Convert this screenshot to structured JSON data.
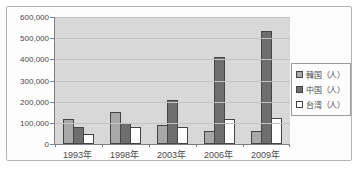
{
  "chart_data": {
    "type": "bar",
    "title": "",
    "categories": [
      "1993年",
      "1998年",
      "2003年",
      "2006年",
      "2009年"
    ],
    "series": [
      {
        "key": "korea",
        "name": "韓国（人）",
        "color": "#a8a8a8",
        "values": [
          120000,
          150000,
          90000,
          60000,
          60000
        ]
      },
      {
        "key": "china",
        "name": "中国（人）",
        "color": "#6e6e6e",
        "values": [
          80000,
          100000,
          210000,
          410000,
          535000
        ]
      },
      {
        "key": "taiwan",
        "name": "台湾（人）",
        "color": "#ffffff",
        "values": [
          45000,
          80000,
          80000,
          120000,
          125000
        ]
      }
    ],
    "xlabel": "",
    "ylabel": "",
    "ylim": [
      0,
      600000
    ],
    "yticks": [
      {
        "value": 0,
        "label": "0"
      },
      {
        "value": 100000,
        "label": "100,000"
      },
      {
        "value": 200000,
        "label": "200,000"
      },
      {
        "value": 300000,
        "label": "300,000"
      },
      {
        "value": 400000,
        "label": "400,000"
      },
      {
        "value": 500000,
        "label": "500,000"
      },
      {
        "value": 600000,
        "label": "600,000"
      }
    ],
    "grid": true,
    "legend_position": "right",
    "plot_background": "#d8d8d8",
    "gridline_color": "#c3c3c3",
    "bar_border_color": "#454545"
  }
}
